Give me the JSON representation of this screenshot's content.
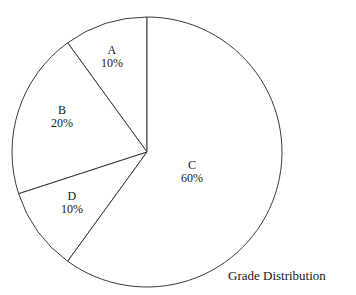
{
  "chart_data": {
    "type": "pie",
    "title": "Grade Distribution",
    "xlabel": "",
    "ylabel": "",
    "grid": false,
    "legend": "none",
    "labels_inside_slices": true,
    "start_angle_deg": 90,
    "direction": "counterclockwise",
    "units": "percent",
    "categories": [
      "A",
      "B",
      "D",
      "C"
    ],
    "values": [
      10,
      20,
      10,
      60
    ],
    "slices": [
      {
        "label": "A",
        "value": 10,
        "value_text": "10%",
        "start_deg": 0,
        "end_deg": 36,
        "label_x": 112,
        "label_y": 57
      },
      {
        "label": "B",
        "value": 20,
        "value_text": "20%",
        "start_deg": 36,
        "end_deg": 108,
        "label_x": 62,
        "label_y": 117
      },
      {
        "label": "D",
        "value": 10,
        "value_text": "10%",
        "start_deg": 108,
        "end_deg": 144,
        "label_x": 72,
        "label_y": 203
      },
      {
        "label": "C",
        "value": 60,
        "value_text": "60%",
        "start_deg": 144,
        "end_deg": 360,
        "label_x": 192,
        "label_y": 172
      }
    ],
    "geometry": {
      "center_x": 147,
      "center_y": 152,
      "radius": 135
    },
    "colors": {
      "background": "#ffffff",
      "slice_fill": "#ffffff",
      "stroke": "#3a3a3a",
      "text": "#171717"
    },
    "title_position": {
      "x": 228,
      "y": 268
    }
  }
}
